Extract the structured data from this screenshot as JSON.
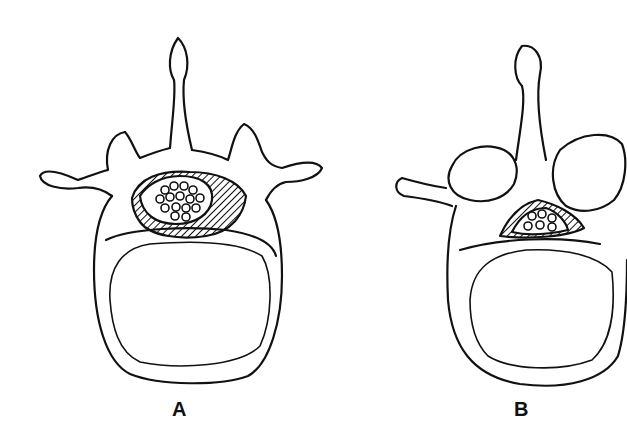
{
  "figure": {
    "panels": [
      {
        "label": "A",
        "description": "Normal lumbar vertebra, superior view, open spinal canal with cauda equina"
      },
      {
        "label": "B",
        "description": "Degenerated lumbar vertebra with facet hypertrophy and narrowed canal"
      }
    ]
  },
  "colors": {
    "ink": "#111111",
    "paper": "#ffffff"
  }
}
